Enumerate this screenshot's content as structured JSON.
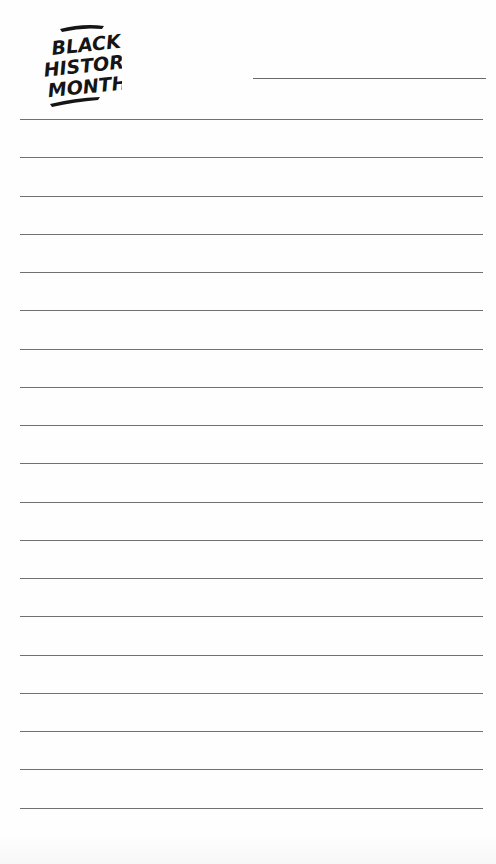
{
  "logo": {
    "lines": [
      "BLACK",
      "HISTORY",
      "MONTH"
    ],
    "color": "#151515"
  },
  "header": {
    "name_field_line": true
  },
  "ruled_lines": {
    "count": 19,
    "first_y": 119,
    "spacing": 38.25,
    "color": "#707070"
  },
  "colors": {
    "background": "#fefefe",
    "line": "#707070",
    "logo": "#151515"
  }
}
